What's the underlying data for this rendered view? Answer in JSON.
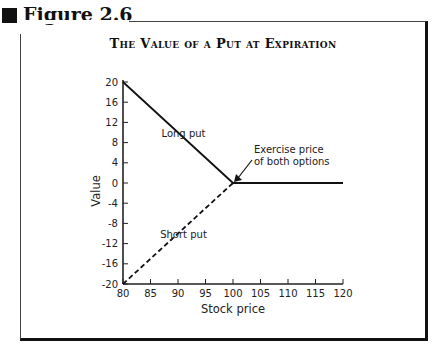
{
  "figure": {
    "label": "Figure 2.6"
  },
  "chart_data": {
    "type": "line",
    "title": "The Value of a Put at Expiration",
    "xlabel": "Stock price",
    "ylabel": "Value",
    "xlim": [
      80,
      120
    ],
    "ylim": [
      -20,
      20
    ],
    "x_ticks": [
      80,
      85,
      90,
      95,
      100,
      105,
      110,
      115,
      120
    ],
    "y_ticks": [
      20,
      16,
      12,
      8,
      4,
      0,
      -4,
      -8,
      -12,
      -16,
      -20
    ],
    "grid": false,
    "legend": null,
    "series": [
      {
        "name": "Long put",
        "style": "solid",
        "x": [
          80,
          100,
          120
        ],
        "y": [
          20,
          0,
          0
        ]
      },
      {
        "name": "Short put",
        "style": "dashed",
        "x": [
          80,
          100
        ],
        "y": [
          -20,
          0
        ]
      }
    ],
    "annotations": [
      {
        "text": "Long put",
        "x": 91,
        "y": 10
      },
      {
        "text": "Short put",
        "x": 91,
        "y": -10
      },
      {
        "text": "Exercise price of both options",
        "arrow_to": [
          100,
          0
        ]
      }
    ]
  },
  "labels": {
    "long_put": "Long put",
    "short_put": "Short put",
    "exercise_line1": "Exercise price",
    "exercise_line2": "of both options"
  }
}
